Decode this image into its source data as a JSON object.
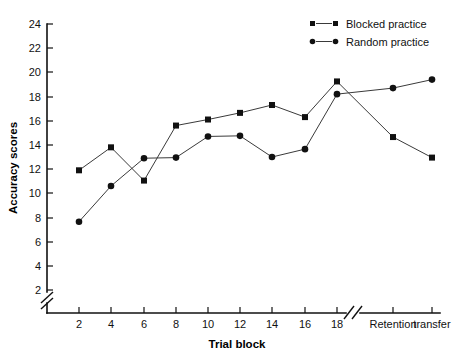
{
  "chart_data": {
    "type": "line",
    "title": "",
    "xlabel": "Trial block",
    "ylabel": "Accuracy scores",
    "ylim": [
      2,
      24
    ],
    "ytick_step": 2,
    "yticks": [
      2,
      4,
      6,
      8,
      10,
      12,
      14,
      16,
      18,
      20,
      22,
      24
    ],
    "grid": false,
    "y_axis_break": true,
    "x_axis_break": true,
    "legend_position": "top-right",
    "categories": [
      "2",
      "4",
      "6",
      "8",
      "10",
      "12",
      "14",
      "16",
      "18",
      "Retention",
      "transfer"
    ],
    "x_tick_labels": [
      "2",
      "4",
      "6",
      "8",
      "10",
      "12",
      "14",
      "16",
      "18"
    ],
    "x_extra_labels": [
      "Retention",
      "transfer"
    ],
    "series": [
      {
        "name": "Blocked practice",
        "marker": "square",
        "color": "#111111",
        "values": [
          11.9,
          13.8,
          11.05,
          15.6,
          16.1,
          16.65,
          17.3,
          16.3,
          19.25,
          14.65,
          12.95
        ]
      },
      {
        "name": "Random practice",
        "marker": "circle",
        "color": "#111111",
        "values": [
          7.65,
          10.6,
          12.9,
          12.95,
          14.7,
          14.75,
          13.0,
          13.65,
          18.2,
          18.7,
          19.4
        ]
      }
    ]
  },
  "axes": {
    "y_title": "Accuracy scores",
    "x_title": "Trial block"
  },
  "legend": {
    "items": [
      {
        "label": "Blocked practice",
        "marker": "square"
      },
      {
        "label": "Random practice",
        "marker": "circle"
      }
    ]
  }
}
